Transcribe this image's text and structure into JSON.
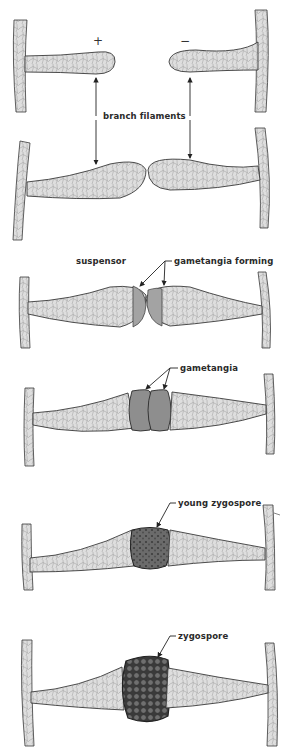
{
  "figure": {
    "stages": [
      {
        "id": "separate",
        "labels": {
          "plus": "+",
          "minus": "−",
          "branch": "branch filaments"
        }
      },
      {
        "id": "contact"
      },
      {
        "id": "gametangia-forming",
        "labels": {
          "suspensor": "suspensor",
          "pointer": "gametangia forming"
        }
      },
      {
        "id": "gametangia",
        "labels": {
          "pointer": "gametangia"
        }
      },
      {
        "id": "young-zygospore",
        "labels": {
          "pointer": "young zygospore"
        }
      },
      {
        "id": "zygospore",
        "labels": {
          "pointer": "zygospore"
        }
      }
    ],
    "colors": {
      "hypha_fill": "#dcdcdc",
      "hypha_stroke": "#3a3a3a",
      "gametangium_fill": "#8e8e8e",
      "young_zygospore_fill": "#6a6a6a",
      "zygospore_fill": "#4a4a4a",
      "arrow": "#222222"
    }
  }
}
